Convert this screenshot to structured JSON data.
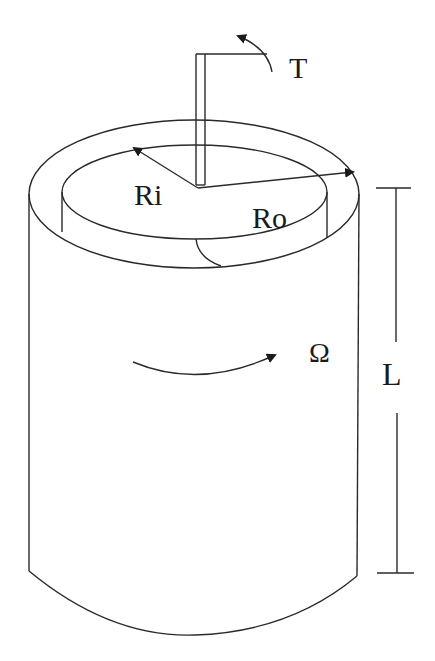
{
  "diagram": {
    "labels": {
      "torque": "T",
      "inner_radius": "Ri",
      "outer_radius": "Ro",
      "angular_velocity": "Ω",
      "length": "L"
    },
    "colors": {
      "line": "#2a2a2a",
      "background": "#ffffff"
    }
  }
}
